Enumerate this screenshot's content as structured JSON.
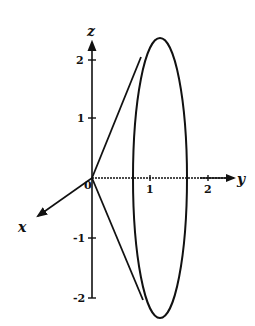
{
  "diagram": {
    "type": "3d-coordinate-sketch",
    "colors": {
      "stroke": "#111111",
      "background": "#ffffff"
    },
    "axes": {
      "z": {
        "label": "z",
        "ticks": [
          "2",
          "1",
          "-1",
          "-2"
        ]
      },
      "y": {
        "label": "y",
        "ticks": [
          "1",
          "2"
        ]
      },
      "x": {
        "label": "x"
      },
      "origin_label": "0"
    },
    "ellipse": {
      "center_y": 1.2,
      "center_z": 0,
      "semi_y": 0.45,
      "semi_z": 2.35
    }
  }
}
